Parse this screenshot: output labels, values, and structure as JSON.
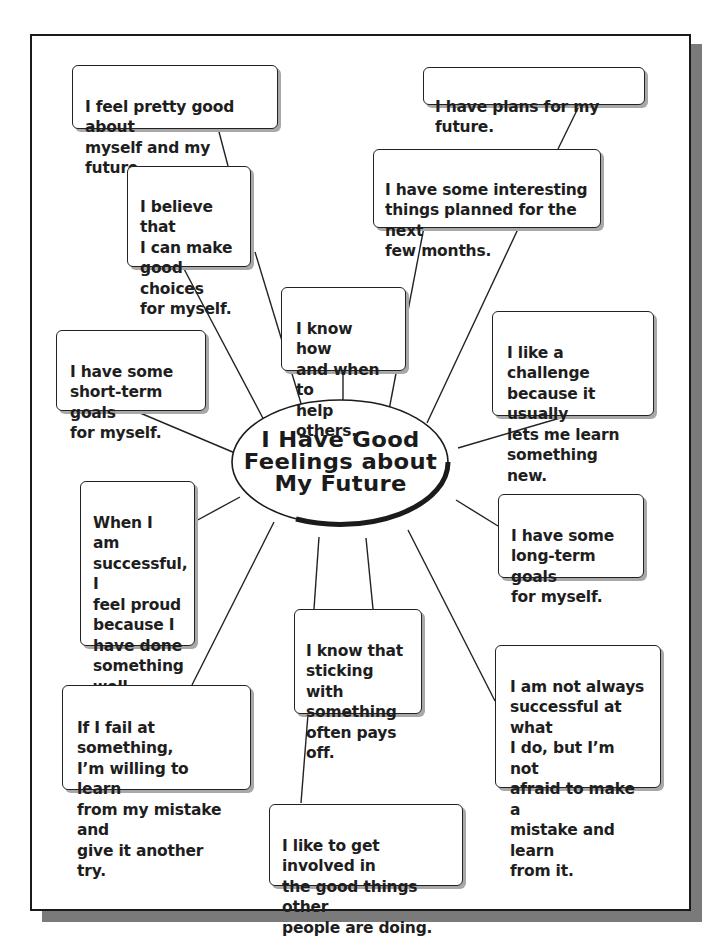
{
  "diagram": {
    "type": "concept-web",
    "center": {
      "title": "I Have Good\nFeelings about\nMy Future"
    },
    "statements": [
      {
        "id": "feel-good",
        "text": "I feel pretty good about\nmyself and my future."
      },
      {
        "id": "good-choices",
        "text": "I believe that\nI can make\ngood choices\nfor myself."
      },
      {
        "id": "plans",
        "text": "I have plans for my future."
      },
      {
        "id": "interesting-things",
        "text": "I have some interesting\nthings planned for the next\nfew months."
      },
      {
        "id": "help-others",
        "text": "I know how\nand when to\nhelp others."
      },
      {
        "id": "challenge",
        "text": "I like a challenge\nbecause it usually\nlets me learn\nsomething new."
      },
      {
        "id": "short-term-goals",
        "text": "I have some\nshort-term goals\nfor myself."
      },
      {
        "id": "feel-proud",
        "text": "When I am\nsuccessful, I\nfeel proud\nbecause I\nhave done\nsomething\nwell."
      },
      {
        "id": "long-term-goals",
        "text": "I have some\nlong-term goals\nfor myself."
      },
      {
        "id": "sticking-with",
        "text": "I know that\nsticking with\nsomething\noften pays off."
      },
      {
        "id": "not-afraid-mistake",
        "text": "I am not always\nsuccessful at what\nI do, but I’m not\nafraid to make a\nmistake and learn\nfrom it."
      },
      {
        "id": "learn-from-mistake",
        "text": "If I fail at something,\nI’m willing to learn\nfrom my mistake and\ngive it another try."
      },
      {
        "id": "get-involved",
        "text": "I like to get involved in\nthe good things other\npeople are doing."
      }
    ]
  }
}
